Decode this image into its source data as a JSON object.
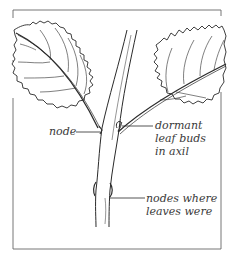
{
  "figure": {
    "frame_color": "#555555",
    "ink_color": "#2a2a2a",
    "labels": {
      "node": {
        "lines": [
          "node"
        ]
      },
      "dormant_buds": {
        "lines": [
          "dormant",
          "leaf buds",
          "in axil"
        ]
      },
      "old_nodes": {
        "lines": [
          "nodes where",
          "leaves were"
        ]
      }
    }
  }
}
